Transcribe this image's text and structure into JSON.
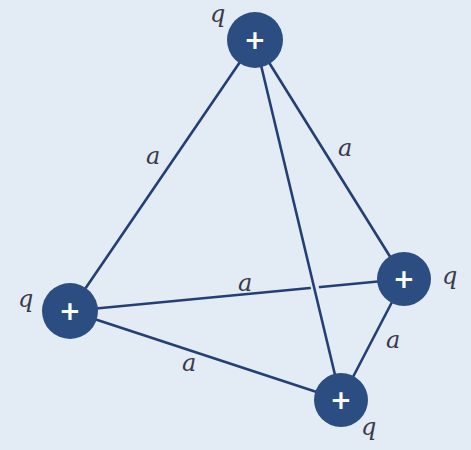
{
  "diagram": {
    "colors": {
      "background": "#e3ecf5",
      "charge_fill": "#2c4d82",
      "edge": "#233f73",
      "sign": "#ffffff"
    },
    "charges": [
      {
        "id": "top",
        "sign": "+",
        "label": "q"
      },
      {
        "id": "left",
        "sign": "+",
        "label": "q"
      },
      {
        "id": "right",
        "sign": "+",
        "label": "q"
      },
      {
        "id": "bottom",
        "sign": "+",
        "label": "q"
      }
    ],
    "edges": [
      {
        "id": "top-left",
        "label": "a"
      },
      {
        "id": "top-right",
        "label": "a"
      },
      {
        "id": "top-bottom",
        "label": ""
      },
      {
        "id": "left-right",
        "label": "a"
      },
      {
        "id": "left-bottom",
        "label": "a"
      },
      {
        "id": "right-bottom",
        "label": "a"
      }
    ]
  }
}
